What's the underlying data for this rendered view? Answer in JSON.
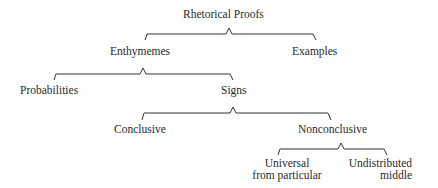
{
  "diagram": {
    "root": "Rhetorical Proofs",
    "nodes": {
      "rhetorical_proofs": "Rhetorical Proofs",
      "enthymemes": "Enthymemes",
      "examples": "Examples",
      "probabilities": "Probabilities",
      "signs": "Signs",
      "conclusive": "Conclusive",
      "nonconclusive": "Nonconclusive",
      "universal_line1": "Universal",
      "universal_line2": "from particular",
      "undistributed_line1": "Undistributed",
      "undistributed_line2": "middle"
    },
    "edges": [
      [
        "Rhetorical Proofs",
        "Enthymemes"
      ],
      [
        "Rhetorical Proofs",
        "Examples"
      ],
      [
        "Enthymemes",
        "Probabilities"
      ],
      [
        "Enthymemes",
        "Signs"
      ],
      [
        "Signs",
        "Conclusive"
      ],
      [
        "Signs",
        "Nonconclusive"
      ],
      [
        "Nonconclusive",
        "Universal from particular"
      ],
      [
        "Nonconclusive",
        "Undistributed middle"
      ]
    ]
  }
}
